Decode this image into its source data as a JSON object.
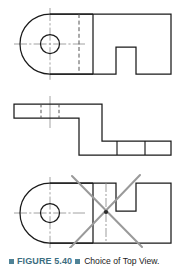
{
  "figure": {
    "caption_label": "FIGURE 5.40",
    "caption_text": "Choice of Top View.",
    "caption_color": "#3c6e7f",
    "marker_color": "#4f8296",
    "background": "#ffffff"
  },
  "drawing": {
    "line_color": "#1a1a1a",
    "centerline_color": "#8c8c8c",
    "hidden_line_color": "#555555",
    "reject_mark_color": "#9a9a9a",
    "object_name": "bracket-with-notch",
    "views": [
      {
        "name": "top-view-preferred",
        "label": "",
        "accepted": "true",
        "features": [
          "rounded-left-end",
          "through-hole",
          "rectangular-notch-lower-edge",
          "hidden-line-step",
          "horizontal-centerline",
          "vertical-centerline"
        ],
        "outline": "M 93,14 L 171,14 L 171,74 L 136,74 L 136,47 L 116,47 L 116,74 L 50,74 A 30,30 0 0 1 50,14 Z",
        "hole": {
          "cx": 50,
          "cy": 44,
          "r": 9.5
        },
        "hidden_line": {
          "x": 79,
          "y1": 14,
          "y2": 74
        },
        "solid_break_line": {
          "x": 93,
          "y1": 14,
          "y2": 74
        },
        "centerline_h": {
          "x1": 14,
          "x2": 85,
          "y": 44
        },
        "centerline_v": {
          "y1": 8,
          "y2": 80,
          "x": 50
        }
      },
      {
        "name": "front-view",
        "label": "",
        "accepted": "true",
        "features": [
          "stepped-profile",
          "hidden-hole-lines",
          "vertical-centerline",
          "division-lines"
        ],
        "outline": "M 14,104 L 102,104 L 102,141 L 171,141 L 171,155 L 79,155 L 79,118 L 14,118 Z",
        "hidden_lines": [
          {
            "x": 41,
            "y1": 104,
            "y2": 118
          },
          {
            "x": 59,
            "y1": 104,
            "y2": 118
          }
        ],
        "division_lines": [
          {
            "x": 117,
            "y1": 141,
            "y2": 155
          },
          {
            "x": 145,
            "y1": 141,
            "y2": 155
          }
        ],
        "centerline_v": {
          "x": 50,
          "y1": 96,
          "y2": 128
        }
      },
      {
        "name": "top-view-rejected",
        "label": "",
        "accepted": "false",
        "features": [
          "rounded-left-end",
          "through-hole",
          "rectangular-notch-upper-edge",
          "hidden-line-step",
          "crossed-out"
        ],
        "outline": "M 93,183 L 116,183 L 116,211 L 136,211 L 136,183 L 171,183 L 171,243 L 50,243 A 30,30 0 0 1 50,183 Z",
        "hole": {
          "cx": 50,
          "cy": 213,
          "r": 9.5
        },
        "hidden_line": {
          "x": 93,
          "y1": 183,
          "y2": 243
        },
        "centerline_h": {
          "x1": 14,
          "x2": 85,
          "y": 213
        },
        "centerline_v": {
          "y1": 177,
          "y2": 249,
          "x": 50
        },
        "reject_cross": [
          {
            "x1": 70,
            "y1": 248,
            "x2": 140,
            "y2": 175
          },
          {
            "x1": 72,
            "y1": 176,
            "x2": 142,
            "y2": 247
          }
        ],
        "reject_dot": {
          "cx": 106,
          "cy": 212,
          "r": 2.1
        }
      }
    ]
  }
}
